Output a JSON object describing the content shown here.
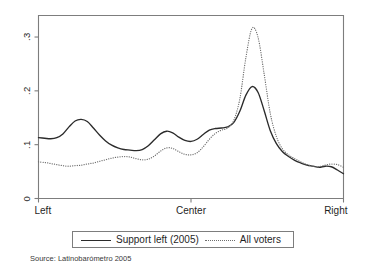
{
  "figure": {
    "background": "#ffffff",
    "frame_color": "#7d7d7d",
    "source_note": "Source: Latinobarómetro 2005"
  },
  "legend": {
    "entries": [
      {
        "label": "Support left (2005)",
        "style": "solid",
        "color": "#2b2b2b"
      },
      {
        "label": "All voters",
        "style": "dotted",
        "color": "#6d6d6d"
      }
    ]
  },
  "chart_data": {
    "type": "line",
    "title": "",
    "subtitle": "",
    "xlabel": "",
    "ylabel": "",
    "xlim": [
      0,
      10
    ],
    "ylim": [
      0,
      0.34
    ],
    "grid": false,
    "legend_position": "below-plot",
    "x_tick_labels": [
      "Left",
      "Center",
      "Right"
    ],
    "x_tick_values": [
      0,
      5,
      10
    ],
    "y_tick_labels": [
      "0",
      ".1",
      ".2",
      ".3"
    ],
    "y_tick_values": [
      0,
      0.1,
      0.2,
      0.3
    ],
    "annotations": [
      "Source: Latinobarómetro 2005"
    ],
    "x": [
      0.0,
      0.2,
      0.4,
      0.6,
      0.8,
      1.0,
      1.2,
      1.4,
      1.6,
      1.8,
      2.0,
      2.2,
      2.4,
      2.6,
      2.8,
      3.0,
      3.2,
      3.4,
      3.6,
      3.8,
      4.0,
      4.2,
      4.4,
      4.6,
      4.8,
      5.0,
      5.2,
      5.4,
      5.6,
      5.8,
      6.0,
      6.2,
      6.4,
      6.6,
      6.8,
      7.0,
      7.2,
      7.4,
      7.6,
      7.8,
      8.0,
      8.2,
      8.4,
      8.6,
      8.8,
      9.0,
      9.2,
      9.4,
      9.6,
      9.8,
      10.0
    ],
    "series": [
      {
        "name": "Support left (2005)",
        "style": "solid",
        "color": "#2b2b2b",
        "values": [
          0.113,
          0.112,
          0.111,
          0.113,
          0.12,
          0.133,
          0.144,
          0.147,
          0.143,
          0.131,
          0.118,
          0.107,
          0.099,
          0.094,
          0.091,
          0.09,
          0.089,
          0.091,
          0.098,
          0.109,
          0.12,
          0.125,
          0.122,
          0.114,
          0.108,
          0.106,
          0.11,
          0.119,
          0.127,
          0.13,
          0.131,
          0.133,
          0.141,
          0.162,
          0.192,
          0.208,
          0.197,
          0.163,
          0.126,
          0.102,
          0.087,
          0.078,
          0.071,
          0.066,
          0.062,
          0.06,
          0.058,
          0.06,
          0.059,
          0.053,
          0.046
        ]
      },
      {
        "name": "All voters",
        "style": "dotted",
        "color": "#6d6d6d",
        "values": [
          0.068,
          0.067,
          0.065,
          0.063,
          0.061,
          0.06,
          0.061,
          0.062,
          0.064,
          0.066,
          0.069,
          0.072,
          0.075,
          0.077,
          0.078,
          0.077,
          0.074,
          0.072,
          0.073,
          0.079,
          0.088,
          0.094,
          0.093,
          0.087,
          0.082,
          0.081,
          0.085,
          0.096,
          0.11,
          0.121,
          0.127,
          0.131,
          0.145,
          0.185,
          0.262,
          0.316,
          0.299,
          0.231,
          0.158,
          0.115,
          0.092,
          0.081,
          0.074,
          0.068,
          0.063,
          0.06,
          0.059,
          0.062,
          0.064,
          0.063,
          0.058
        ]
      }
    ]
  },
  "axes": {
    "y_ticks": [
      {
        "label": ".3",
        "value": 0.3
      },
      {
        "label": ".2",
        "value": 0.2
      },
      {
        "label": ".1",
        "value": 0.1
      },
      {
        "label": "0",
        "value": 0.0
      }
    ],
    "x_ticks": [
      {
        "label": "Left",
        "value": 0
      },
      {
        "label": "Center",
        "value": 5
      },
      {
        "label": "Right",
        "value": 10
      }
    ]
  }
}
